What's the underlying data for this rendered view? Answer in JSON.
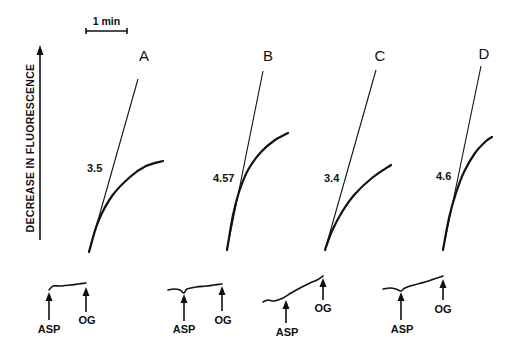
{
  "chart_data": {
    "type": "line",
    "title": "",
    "ylabel": "DECREASE IN FLUORESCENCE",
    "xlabel": "",
    "scale_bar": {
      "label": "1 min",
      "x1": 86,
      "x2": 127,
      "y": 31
    },
    "y_axis_arrow": {
      "x": 40,
      "y_top": 45,
      "y_bottom": 240
    },
    "grid": false,
    "legend": null,
    "panels": [
      {
        "name": "A",
        "rate_label": "3.5",
        "initial_rate": 3.5,
        "letter_pos": [
          144,
          61
        ],
        "rate_pos": [
          87,
          172
        ],
        "tangent": {
          "x1": 89,
          "y1": 252,
          "x2": 138,
          "y2": 79
        },
        "curve": [
          [
            89,
            252
          ],
          [
            98,
            222
          ],
          [
            112,
            196
          ],
          [
            130,
            177
          ],
          [
            146,
            166
          ],
          [
            163,
            161
          ]
        ],
        "trace": [
          [
            49,
            290
          ],
          [
            53,
            286
          ],
          [
            60,
            286
          ],
          [
            70,
            285
          ],
          [
            78,
            284
          ],
          [
            86,
            283
          ]
        ],
        "triggers": [
          {
            "label": "ASP",
            "x": 49,
            "y_tip": 292,
            "y_base": 320,
            "label_x": 49,
            "label_y": 333
          },
          {
            "label": "OG",
            "x": 86,
            "y_tip": 287,
            "y_base": 312,
            "label_x": 87,
            "label_y": 324
          }
        ]
      },
      {
        "name": "B",
        "rate_label": "4.57",
        "initial_rate": 4.57,
        "letter_pos": [
          268,
          61
        ],
        "rate_pos": [
          213,
          182
        ],
        "tangent": {
          "x1": 227,
          "y1": 250,
          "x2": 263,
          "y2": 71
        },
        "curve": [
          [
            227,
            250
          ],
          [
            233,
            215
          ],
          [
            239,
            192
          ],
          [
            248,
            170
          ],
          [
            261,
            152
          ],
          [
            275,
            140
          ],
          [
            288,
            133
          ]
        ],
        "trace": [
          [
            168,
            290
          ],
          [
            174,
            289
          ],
          [
            180,
            290
          ],
          [
            184,
            293
          ],
          [
            187,
            289
          ],
          [
            196,
            287
          ],
          [
            206,
            286
          ],
          [
            214,
            285
          ],
          [
            222,
            284
          ]
        ],
        "triggers": [
          {
            "label": "ASP",
            "x": 184,
            "y_tip": 294,
            "y_base": 321,
            "label_x": 184,
            "label_y": 333
          },
          {
            "label": "OG",
            "x": 222,
            "y_tip": 286,
            "y_base": 311,
            "label_x": 223,
            "label_y": 324
          }
        ]
      },
      {
        "name": "C",
        "rate_label": "3.4",
        "initial_rate": 3.4,
        "letter_pos": [
          380,
          61
        ],
        "rate_pos": [
          324,
          182
        ],
        "tangent": {
          "x1": 325,
          "y1": 250,
          "x2": 376,
          "y2": 70
        },
        "curve": [
          [
            325,
            250
          ],
          [
            332,
            231
          ],
          [
            342,
            212
          ],
          [
            355,
            194
          ],
          [
            372,
            178
          ],
          [
            391,
            165
          ]
        ],
        "trace": [
          [
            263,
            302
          ],
          [
            268,
            300
          ],
          [
            274,
            301
          ],
          [
            283,
            298
          ],
          [
            291,
            293
          ],
          [
            300,
            288
          ],
          [
            310,
            283
          ],
          [
            317,
            280
          ],
          [
            323,
            276
          ]
        ],
        "triggers": [
          {
            "label": "ASP",
            "x": 286,
            "y_tip": 300,
            "y_base": 323,
            "label_x": 287,
            "label_y": 336
          },
          {
            "label": "OG",
            "x": 323,
            "y_tip": 278,
            "y_base": 300,
            "label_x": 323,
            "label_y": 312
          }
        ]
      },
      {
        "name": "D",
        "rate_label": "4.6",
        "initial_rate": 4.6,
        "letter_pos": [
          484,
          59
        ],
        "rate_pos": [
          436,
          180
        ],
        "tangent": {
          "x1": 443,
          "y1": 250,
          "x2": 481,
          "y2": 66
        },
        "curve": [
          [
            443,
            250
          ],
          [
            449,
            218
          ],
          [
            456,
            193
          ],
          [
            464,
            172
          ],
          [
            475,
            153
          ],
          [
            485,
            142
          ],
          [
            492,
            137
          ]
        ],
        "trace": [
          [
            383,
            289
          ],
          [
            390,
            288
          ],
          [
            396,
            289
          ],
          [
            401,
            291
          ],
          [
            405,
            288
          ],
          [
            414,
            285
          ],
          [
            425,
            282
          ],
          [
            434,
            279
          ],
          [
            443,
            276
          ]
        ],
        "triggers": [
          {
            "label": "ASP",
            "x": 401,
            "y_tip": 292,
            "y_base": 320,
            "label_x": 402,
            "label_y": 333
          },
          {
            "label": "OG",
            "x": 443,
            "y_tip": 279,
            "y_base": 300,
            "label_x": 443,
            "label_y": 313
          }
        ]
      }
    ]
  }
}
